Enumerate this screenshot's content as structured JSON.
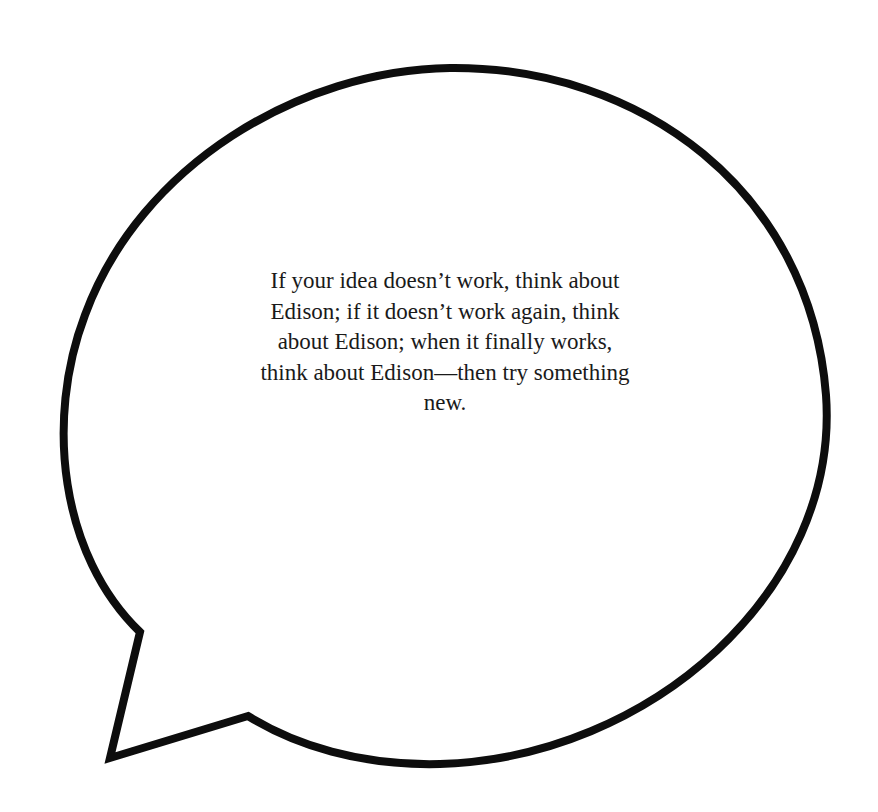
{
  "speech_bubble": {
    "stroke_color": "#0d0d0d",
    "fill_color": "#ffffff",
    "quote_lines": [
      "If your idea doesn’t work, think about",
      "Edison; if it doesn’t work again, think",
      "about Edison; when it finally works,",
      "think about Edison—then try something",
      "new."
    ],
    "quote_full": "If your idea doesn’t work, think about Edison; if it doesn’t work again, think about Edison; when it finally works, think about Edison—then try something new."
  }
}
